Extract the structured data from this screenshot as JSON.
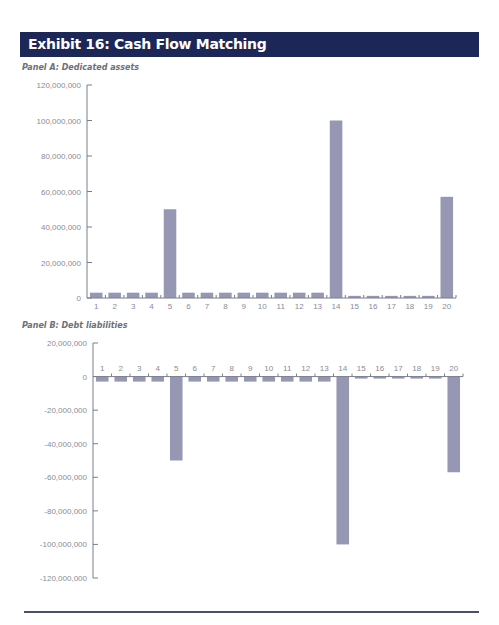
{
  "header": {
    "title": "Exhibit 16: Cash Flow Matching"
  },
  "panels": {
    "a": {
      "title": "Panel A: Dedicated assets"
    },
    "b": {
      "title": "Panel B: Debt liabilities"
    }
  },
  "colors": {
    "header_bg": "#1c2757",
    "bar": "#9597b3",
    "axis": "#7b7e8c",
    "tick_label": "#8a8c96"
  },
  "chart_data": [
    {
      "type": "bar",
      "title": "Panel A: Dedicated assets",
      "xlabel": "",
      "ylabel": "",
      "categories": [
        "1",
        "2",
        "3",
        "4",
        "5",
        "6",
        "7",
        "8",
        "9",
        "10",
        "11",
        "12",
        "13",
        "14",
        "15",
        "16",
        "17",
        "18",
        "19",
        "20"
      ],
      "values": [
        3000000,
        3000000,
        3000000,
        3000000,
        50000000,
        3000000,
        3000000,
        3000000,
        3000000,
        3000000,
        3000000,
        3000000,
        3000000,
        100000000,
        1200000,
        1200000,
        1200000,
        1200000,
        1200000,
        57000000
      ],
      "ylim": [
        0,
        120000000
      ],
      "yticks": [
        "120,000,000",
        "100,000,000",
        "80,000,000",
        "60,000,000",
        "40,000,000",
        "20,000,000",
        "0"
      ],
      "grid": false,
      "legend": null
    },
    {
      "type": "bar",
      "title": "Panel B: Debt liabilities",
      "xlabel": "",
      "ylabel": "",
      "categories": [
        "1",
        "2",
        "3",
        "4",
        "5",
        "6",
        "7",
        "8",
        "9",
        "10",
        "11",
        "12",
        "13",
        "14",
        "15",
        "16",
        "17",
        "18",
        "19",
        "20"
      ],
      "values": [
        -3000000,
        -3000000,
        -3000000,
        -3000000,
        -50000000,
        -3000000,
        -3000000,
        -3000000,
        -3000000,
        -3000000,
        -3000000,
        -3000000,
        -3000000,
        -100000000,
        -1200000,
        -1200000,
        -1200000,
        -1200000,
        -1200000,
        -57000000
      ],
      "ylim": [
        -120000000,
        20000000
      ],
      "yticks": [
        "20,000,000",
        "0",
        "-20,000,000",
        "-40,000,000",
        "-60,000,000",
        "-80,000,000",
        "-100,000,000",
        "-120,000,000"
      ],
      "grid": false,
      "legend": null
    }
  ]
}
